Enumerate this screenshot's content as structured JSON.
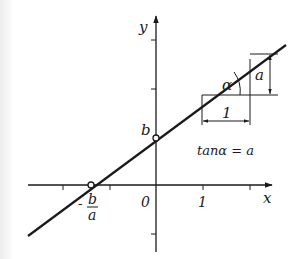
{
  "diagram": {
    "type": "linear-function-graph",
    "axes": {
      "x_label": "x",
      "y_label": "y",
      "origin_label": "0",
      "x_tick_label": "1"
    },
    "line": {
      "intercept_label": "b",
      "root_label_numerator": "b",
      "root_label_denominator": "a",
      "root_label_sign": "-"
    },
    "slope_triangle": {
      "angle_label": "α",
      "rise_label": "a",
      "run_label": "1"
    },
    "formula": "tanα = a",
    "colors": {
      "ink": "#1a1a1a",
      "background": "#ffffff"
    }
  }
}
